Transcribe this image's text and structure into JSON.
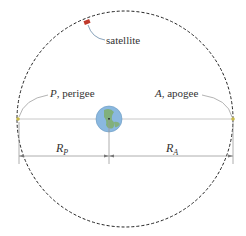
{
  "diagram": {
    "labels": {
      "satellite": "satellite",
      "perigee_letter": "P",
      "perigee_text": ", perigee",
      "apogee_letter": "A",
      "apogee_text": ", apogee",
      "rp_main": "R",
      "rp_sub": "P",
      "ra_main": "R",
      "ra_sub": "A"
    },
    "colors": {
      "orbit": "#222222",
      "axis_line": "#c8c8c8",
      "dimension_line": "#999999",
      "leader_line": "#a0a0a0",
      "satellite": "#c0392b",
      "earth_ocean": "#8ab8e0",
      "earth_land": "#7fae6a",
      "perigee_apogee_point": "#c8b84a"
    },
    "elements": [
      "orbit-ellipse",
      "earth",
      "satellite",
      "perigee-point",
      "apogee-point",
      "major-axis",
      "rp-dimension",
      "ra-dimension"
    ]
  }
}
